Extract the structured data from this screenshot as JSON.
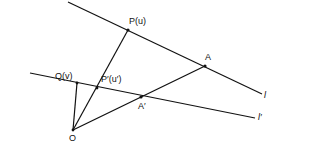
{
  "diagram": {
    "labels": {
      "P": "P(u)",
      "P_prime": "P′(u′)",
      "Q": "Q(v)",
      "A": "A",
      "A_prime": "A′",
      "O": "O",
      "l": "l",
      "l_prime": "l′"
    },
    "points": {
      "O": [
        73,
        130
      ],
      "P": [
        128,
        30
      ],
      "P_prime": [
        97,
        88
      ],
      "Q": [
        77,
        83
      ],
      "A": [
        205,
        66
      ],
      "A_prime": [
        141,
        97
      ]
    },
    "lines": {
      "l": [
        [
          68,
          2
        ],
        [
          262,
          94
        ]
      ],
      "l_prime": [
        [
          30,
          73
        ],
        [
          255,
          118
        ]
      ]
    },
    "stroke_color": "#111111"
  }
}
